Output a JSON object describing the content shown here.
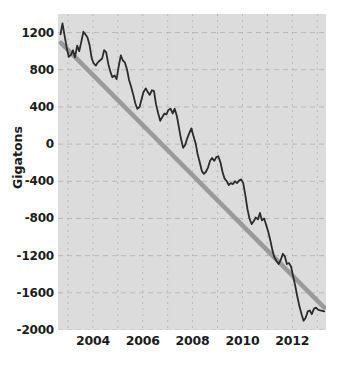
{
  "chart_data": {
    "type": "line",
    "title": "",
    "subtitle": "",
    "xlabel": "",
    "ylabel": "Gigatons",
    "xlim": [
      2002.6,
      2013.35
    ],
    "ylim": [
      -2000,
      1400
    ],
    "grid": true,
    "legend": false,
    "y_ticks": [
      1200,
      800,
      400,
      0,
      -400,
      -800,
      -1200,
      -1600,
      -2000
    ],
    "y_tick_labels": [
      "1200",
      "800",
      "400",
      "0",
      "-400",
      "-800",
      "-1200",
      "-1600",
      "-2000"
    ],
    "x_ticks": [
      2004,
      2006,
      2008,
      2010,
      2012
    ],
    "x_tick_labels": [
      "2004",
      "2006",
      "2008",
      "2010",
      "2012"
    ],
    "background_color": "#dcdcdc",
    "gridline_color": "#b4b4b4",
    "series": [
      {
        "name": "Ice mass anomaly",
        "type": "line",
        "color": "#2b2b2b",
        "width": 1.8,
        "x": [
          2002.7,
          2002.78,
          2002.87,
          2002.95,
          2003.03,
          2003.12,
          2003.2,
          2003.28,
          2003.37,
          2003.45,
          2003.53,
          2003.62,
          2003.7,
          2003.78,
          2003.87,
          2003.95,
          2004.03,
          2004.12,
          2004.2,
          2004.28,
          2004.37,
          2004.45,
          2004.53,
          2004.62,
          2004.7,
          2004.78,
          2004.87,
          2004.95,
          2005.03,
          2005.12,
          2005.2,
          2005.28,
          2005.37,
          2005.45,
          2005.53,
          2005.62,
          2005.7,
          2005.78,
          2005.87,
          2005.95,
          2006.03,
          2006.12,
          2006.2,
          2006.28,
          2006.37,
          2006.45,
          2006.53,
          2006.62,
          2006.7,
          2006.78,
          2006.87,
          2006.95,
          2007.03,
          2007.12,
          2007.2,
          2007.28,
          2007.37,
          2007.45,
          2007.53,
          2007.62,
          2007.7,
          2007.78,
          2007.87,
          2007.95,
          2008.03,
          2008.12,
          2008.2,
          2008.28,
          2008.37,
          2008.45,
          2008.53,
          2008.62,
          2008.7,
          2008.78,
          2008.87,
          2008.95,
          2009.03,
          2009.12,
          2009.2,
          2009.28,
          2009.37,
          2009.45,
          2009.53,
          2009.62,
          2009.7,
          2009.78,
          2009.87,
          2009.95,
          2010.03,
          2010.12,
          2010.2,
          2010.28,
          2010.37,
          2010.45,
          2010.53,
          2010.62,
          2010.7,
          2010.78,
          2010.87,
          2010.95,
          2011.03,
          2011.12,
          2011.2,
          2011.28,
          2011.37,
          2011.45,
          2011.53,
          2011.62,
          2011.7,
          2011.78,
          2011.87,
          2011.95,
          2012.03,
          2012.12,
          2012.2,
          2012.28,
          2012.37,
          2012.45,
          2012.53,
          2012.62,
          2012.7,
          2012.78,
          2012.87,
          2012.95,
          2013.03,
          2013.12,
          2013.2,
          2013.28
        ],
        "y": [
          1180,
          1300,
          1160,
          1035,
          940,
          960,
          1010,
          935,
          1060,
          1000,
          1095,
          1210,
          1180,
          1150,
          1060,
          925,
          870,
          845,
          880,
          900,
          920,
          1010,
          990,
          860,
          780,
          720,
          740,
          700,
          830,
          955,
          900,
          880,
          800,
          690,
          620,
          530,
          440,
          380,
          400,
          480,
          560,
          600,
          560,
          530,
          580,
          570,
          430,
          330,
          250,
          290,
          330,
          320,
          370,
          380,
          330,
          380,
          300,
          180,
          60,
          -40,
          -10,
          60,
          120,
          170,
          90,
          10,
          -110,
          -190,
          -290,
          -320,
          -300,
          -250,
          -180,
          -150,
          -180,
          -140,
          -130,
          -200,
          -300,
          -370,
          -400,
          -440,
          -420,
          -430,
          -400,
          -420,
          -390,
          -380,
          -420,
          -560,
          -700,
          -800,
          -860,
          -830,
          -790,
          -810,
          -740,
          -820,
          -800,
          -870,
          -940,
          -1040,
          -1140,
          -1220,
          -1260,
          -1290,
          -1250,
          -1180,
          -1210,
          -1290,
          -1280,
          -1320,
          -1420,
          -1530,
          -1640,
          -1740,
          -1830,
          -1900,
          -1870,
          -1800,
          -1790,
          -1830,
          -1770,
          -1760,
          -1780,
          -1790,
          -1795,
          -1800
        ]
      },
      {
        "name": "Linear trend",
        "type": "line",
        "color": "#9a9a9a",
        "width": 4.5,
        "x": [
          2002.72,
          2013.28
        ],
        "y": [
          1090,
          -1760
        ]
      }
    ]
  },
  "axes": {
    "y_title": "Gigatons"
  }
}
